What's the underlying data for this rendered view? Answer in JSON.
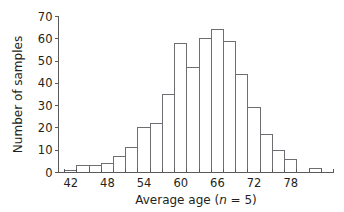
{
  "chart_data": {
    "type": "bar",
    "title": "",
    "subtitle": "",
    "xlabel_parts": {
      "pre": "Average age (",
      "italic": "n",
      "post": " = 5)"
    },
    "xlabel": "Average age (n = 5)",
    "ylabel": "Number of samples",
    "xlim": [
      40,
      85
    ],
    "ylim": [
      0,
      70
    ],
    "grid": false,
    "legend": "none",
    "bin_width": 2,
    "x_tick_interval": 2,
    "x_labeled_ticks": [
      42,
      48,
      54,
      60,
      66,
      72,
      78
    ],
    "x_tick_labels": [
      "42",
      "48",
      "54",
      "60",
      "66",
      "72",
      "78"
    ],
    "y_ticks": [
      0,
      10,
      20,
      30,
      40,
      50,
      60,
      70
    ],
    "y_tick_labels": [
      "0",
      "10",
      "20",
      "30",
      "40",
      "50",
      "60",
      "70"
    ],
    "bin_starts": [
      41,
      43,
      45,
      47,
      49,
      51,
      53,
      55,
      57,
      59,
      61,
      63,
      65,
      67,
      69,
      71,
      73,
      75,
      77,
      81
    ],
    "categories": [
      "41-43",
      "43-45",
      "45-47",
      "47-49",
      "49-51",
      "51-53",
      "53-55",
      "55-57",
      "57-59",
      "59-61",
      "61-63",
      "63-65",
      "65-67",
      "67-69",
      "69-71",
      "71-73",
      "73-75",
      "75-77",
      "77-79",
      "81-83"
    ],
    "values": [
      1,
      3,
      3,
      4,
      7,
      11,
      20,
      22,
      35,
      58,
      47,
      60,
      64,
      59,
      44,
      29,
      17,
      10,
      6,
      2
    ]
  }
}
